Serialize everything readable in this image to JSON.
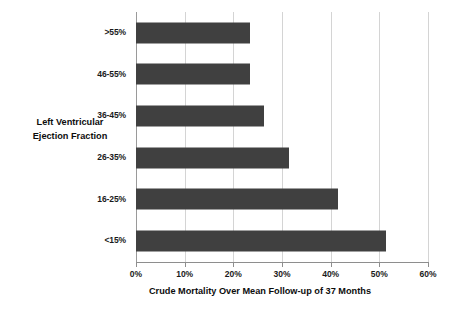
{
  "chart_data": {
    "type": "bar",
    "orientation": "horizontal",
    "title": "",
    "xlabel": "Crude Mortality Over Mean Follow-up of 37 Months",
    "ylabel": "Left Ventricular Ejection Fraction",
    "ylabel_lines": [
      "Left Ventricular",
      "Ejection Fraction"
    ],
    "categories": [
      ">55%",
      "46-55%",
      "36-45%",
      "26-35%",
      "16-25%",
      "<15%"
    ],
    "values": [
      23.5,
      23.5,
      26.3,
      31.4,
      41.5,
      51.3
    ],
    "value_labels": [
      "23.5%",
      "23.5%",
      "26.3%",
      "31.4%",
      "41.5%",
      "51.3%"
    ],
    "xlim": [
      0,
      60
    ],
    "xticks": [
      0,
      10,
      20,
      30,
      40,
      50,
      60
    ],
    "xtick_labels": [
      "0%",
      "10%",
      "20%",
      "30%",
      "40%",
      "50%",
      "60%"
    ],
    "grid": "vertical",
    "legend": "none",
    "bar_color": "#404040",
    "gridline_color": "#d4d4d4",
    "axis_color": "#8e8e8e",
    "background_color": "#ffffff",
    "text_color": "#1a1a1a"
  }
}
